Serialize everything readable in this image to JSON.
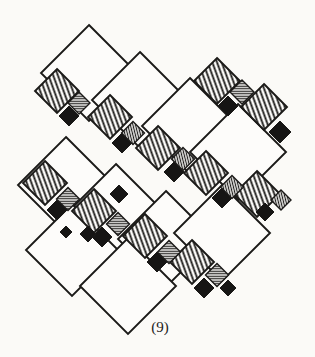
{
  "figure": {
    "label": "(9)",
    "label_x": 160,
    "label_y": 332
  },
  "canvas": {
    "width": 315,
    "height": 357
  },
  "colors": {
    "paper": "#fbfaf7",
    "ink": "#1b1a18",
    "tile_white": "#fdfcfa",
    "black_fill": "#161514"
  },
  "patterns": {
    "hatch_angle": 70,
    "hatch_period": 4.4,
    "hatch_stroke": 1.8,
    "stripe_v_angle": 76,
    "stripe_h_angle": 0,
    "stripe_period": 2.5,
    "stripe_stroke": 1.2,
    "outline_stroke": 1.9
  },
  "tiles": {
    "white": [
      {
        "c": [
          89,
          73
        ],
        "h": 48
      },
      {
        "c": [
          140,
          100
        ],
        "h": 48
      },
      {
        "c": [
          190,
          126
        ],
        "h": 48
      },
      {
        "c": [
          238,
          152
        ],
        "h": 48
      },
      {
        "c": [
          66,
          185
        ],
        "h": 48
      },
      {
        "c": [
          116,
          212
        ],
        "h": 48
      },
      {
        "c": [
          166,
          239
        ],
        "h": 48
      },
      {
        "c": [
          222,
          233
        ],
        "h": 48
      },
      {
        "c": [
          72,
          250
        ],
        "h": 46
      },
      {
        "c": [
          128,
          286
        ],
        "h": 48
      }
    ],
    "hatched": [
      {
        "c": [
          217,
          81
        ],
        "h": 23
      },
      {
        "c": [
          264,
          107
        ],
        "h": 23
      },
      {
        "c": [
          57,
          91
        ],
        "h": 22
      },
      {
        "c": [
          110,
          117
        ],
        "h": 22
      },
      {
        "c": [
          158,
          148
        ],
        "h": 22
      },
      {
        "c": [
          206,
          173
        ],
        "h": 22
      },
      {
        "c": [
          257,
          194
        ],
        "h": 23
      },
      {
        "c": [
          45,
          183
        ],
        "h": 22
      },
      {
        "c": [
          94,
          211
        ],
        "h": 22
      },
      {
        "c": [
          145,
          236
        ],
        "h": 22
      },
      {
        "c": [
          192,
          262
        ],
        "h": 22
      }
    ],
    "black": [
      {
        "c": [
          69,
          116
        ],
        "h": 10
      },
      {
        "c": [
          122,
          143
        ],
        "h": 10
      },
      {
        "c": [
          174,
          172
        ],
        "h": 10
      },
      {
        "c": [
          222,
          198
        ],
        "h": 10
      },
      {
        "c": [
          265,
          212
        ],
        "h": 9
      },
      {
        "c": [
          57,
          210
        ],
        "h": 10
      },
      {
        "c": [
          102,
          237
        ],
        "h": 10
      },
      {
        "c": [
          157,
          262
        ],
        "h": 10
      },
      {
        "c": [
          204,
          288
        ],
        "h": 10
      },
      {
        "c": [
          228,
          288
        ],
        "h": 8
      },
      {
        "c": [
          228,
          106
        ],
        "h": 10
      },
      {
        "c": [
          280,
          132
        ],
        "h": 11
      },
      {
        "c": [
          119,
          194
        ],
        "h": 9
      },
      {
        "c": [
          88,
          234
        ],
        "h": 8
      },
      {
        "c": [
          66,
          232
        ],
        "h": 6
      }
    ],
    "striped": [
      {
        "c": [
          79,
          103
        ],
        "h": 11,
        "dir": "h"
      },
      {
        "c": [
          133,
          133
        ],
        "h": 11.5,
        "dir": "v"
      },
      {
        "c": [
          183,
          159
        ],
        "h": 11.5,
        "dir": "v"
      },
      {
        "c": [
          232,
          187
        ],
        "h": 11.5,
        "dir": "v"
      },
      {
        "c": [
          281,
          200
        ],
        "h": 10,
        "dir": "v"
      },
      {
        "c": [
          242,
          92
        ],
        "h": 12,
        "dir": "h"
      },
      {
        "c": [
          68,
          199
        ],
        "h": 11.5,
        "dir": "h"
      },
      {
        "c": [
          118,
          224
        ],
        "h": 11.5,
        "dir": "h"
      },
      {
        "c": [
          169,
          252
        ],
        "h": 11.5,
        "dir": "h"
      },
      {
        "c": [
          217,
          275
        ],
        "h": 11.5,
        "dir": "h"
      }
    ]
  }
}
